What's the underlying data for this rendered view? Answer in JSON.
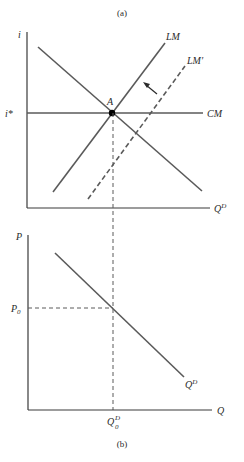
{
  "figure": {
    "top_caption": "(a)",
    "bottom_caption": "(b)"
  },
  "panel_a": {
    "y_axis_label": "i",
    "x_axis_label": "Q",
    "x_axis_sup": "D",
    "rate_label": "i*",
    "point_label": "A",
    "curves": {
      "lm": "LM",
      "lm_prime": "LM′",
      "cm": "CM"
    }
  },
  "panel_b": {
    "y_axis_label": "P",
    "x_axis_label": "Q",
    "price_label": "P",
    "price_sub": "0",
    "quantity_label": "Q",
    "quantity_sup": "D",
    "quantity_sub": "0",
    "demand_label": "Q",
    "demand_sup": "D"
  },
  "colors": {
    "line": "#5a5a5a",
    "axis": "#3a3a3a",
    "text": "#2a2a2a",
    "point": "#000000"
  }
}
